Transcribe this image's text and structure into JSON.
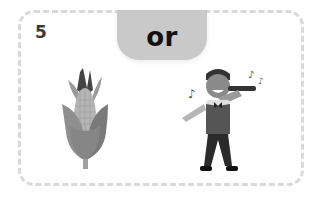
{
  "card": {
    "number": "5",
    "connector": "or"
  },
  "options": [
    {
      "name": "corn",
      "icon": "corn-icon"
    },
    {
      "name": "singer",
      "icon": "singer-icon"
    }
  ],
  "colors": {
    "tab": "#c9c9c9",
    "border": "#d9d9d9",
    "text": "#111111"
  }
}
